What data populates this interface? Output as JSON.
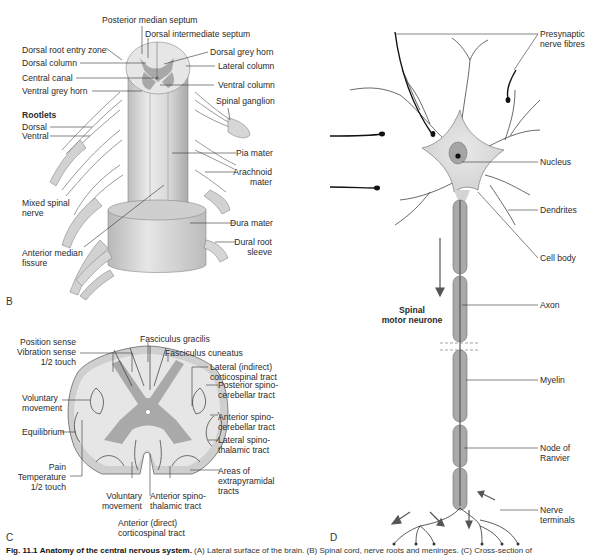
{
  "panels": {
    "B": {
      "letter": "B",
      "labels": {
        "posterior_median_septum": "Posterior median septum",
        "dorsal_intermediate_septum": "Dorsal intermediate septum",
        "dorsal_root_entry_zone": "Dorsal root entry zone",
        "dorsal_grey_horn": "Dorsal grey horn",
        "dorsal_column": "Dorsal column",
        "lateral_column": "Lateral column",
        "central_canal": "Central canal",
        "ventral_column": "Ventral column",
        "ventral_grey_horn": "Ventral grey horn",
        "spinal_ganglion": "Spinal ganglion",
        "rootlets": "Rootlets",
        "dorsal": "Dorsal",
        "ventral": "Ventral",
        "pia_mater": "Pia mater",
        "arachnoid_mater_1": "Arachnoid",
        "arachnoid_mater_2": "mater",
        "mixed_spinal_nerve_1": "Mixed spinal",
        "mixed_spinal_nerve_2": "nerve",
        "dura_mater": "Dura mater",
        "dural_root_sleeve_1": "Dural root",
        "dural_root_sleeve_2": "sleeve",
        "anterior_median_fissure_1": "Anterior median",
        "anterior_median_fissure_2": "fissure"
      }
    },
    "C": {
      "letter": "C",
      "labels": {
        "position_sense": "Position sense",
        "vibration_sense": "Vibration sense",
        "half_touch_top": "1/2 touch",
        "fasciculus_gracilis": "Fasciculus gracilis",
        "fasciculus_cuneatus": "Fasciculus cuneatus",
        "lateral_cst_1": "Lateral (indirect)",
        "lateral_cst_2": "corticospinal tract",
        "voluntary_movement_1": "Voluntary",
        "voluntary_movement_2": "movement",
        "posterior_scb_1": "Posterior spino-",
        "posterior_scb_2": "cerebellar tract",
        "equilibrium": "Equilibrium",
        "anterior_scb_1": "Anterior spino-",
        "anterior_scb_2": "cerebellar tract",
        "lateral_stt_1": "Lateral spino-",
        "lateral_stt_2": "thalamic tract",
        "pain": "Pain",
        "temperature": "Temperature",
        "half_touch_bottom": "1/2 touch",
        "extrapyramidal_1": "Areas of",
        "extrapyramidal_2": "extrapyramidal",
        "extrapyramidal_3": "tracts",
        "voluntary_movement_b1": "Voluntary",
        "voluntary_movement_b2": "movement",
        "anterior_stt_1": "Anterior spino-",
        "anterior_stt_2": "thalamic tract",
        "anterior_cst_1": "Anterior (direct)",
        "anterior_cst_2": "corticospinal tract"
      }
    },
    "D": {
      "letter": "D",
      "labels": {
        "presynaptic_1": "Presynaptic",
        "presynaptic_2": "nerve fibres",
        "nucleus": "Nucleus",
        "dendrites": "Dendrites",
        "cell_body": "Cell body",
        "spinal_motor_1": "Spinal",
        "spinal_motor_2": "motor neurone",
        "axon": "Axon",
        "myelin": "Myelin",
        "node_1": "Node of",
        "node_2": "Ranvier",
        "nerve_terminals_1": "Nerve",
        "nerve_terminals_2": "terminals"
      }
    }
  },
  "caption": {
    "fig": "Fig. 11.1",
    "title": "Anatomy of the central nervous system.",
    "rest": "(A) Lateral surface of the brain. (B) Spinal cord, nerve roots and meninges. (C) Cross-section of"
  },
  "colors": {
    "tissue_light": "#e4e4e4",
    "tissue_mid": "#c8c8c8",
    "grey_matter": "#a9a9a9",
    "axon_dark": "#8c8c8c",
    "line": "#333333"
  }
}
